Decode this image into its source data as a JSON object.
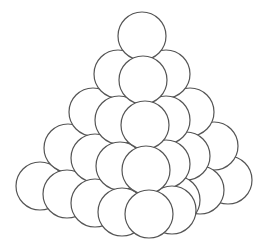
{
  "diagram": {
    "stroke_color": "#555555",
    "fill_color": "#ffffff",
    "radius": 24,
    "circles": [
      {
        "cx": 40,
        "cy": 186
      },
      {
        "cx": 228,
        "cy": 180
      },
      {
        "cx": 68,
        "cy": 148
      },
      {
        "cx": 214,
        "cy": 146
      },
      {
        "cx": 93,
        "cy": 112
      },
      {
        "cx": 190,
        "cy": 112
      },
      {
        "cx": 118,
        "cy": 74
      },
      {
        "cx": 166,
        "cy": 74
      },
      {
        "cx": 142,
        "cy": 36
      },
      {
        "cx": 67,
        "cy": 194
      },
      {
        "cx": 200,
        "cy": 190
      },
      {
        "cx": 95,
        "cy": 158
      },
      {
        "cx": 186,
        "cy": 156
      },
      {
        "cx": 119,
        "cy": 120
      },
      {
        "cx": 166,
        "cy": 120
      },
      {
        "cx": 143,
        "cy": 80
      },
      {
        "cx": 95,
        "cy": 203
      },
      {
        "cx": 176,
        "cy": 200
      },
      {
        "cx": 120,
        "cy": 166
      },
      {
        "cx": 166,
        "cy": 164
      },
      {
        "cx": 145,
        "cy": 125
      },
      {
        "cx": 122,
        "cy": 212
      },
      {
        "cx": 172,
        "cy": 210
      },
      {
        "cx": 146,
        "cy": 170
      },
      {
        "cx": 149,
        "cy": 214
      }
    ]
  }
}
